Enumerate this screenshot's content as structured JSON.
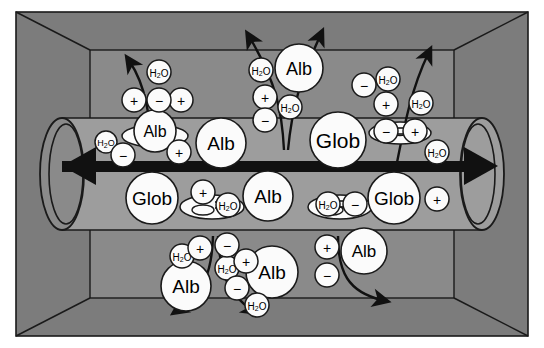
{
  "figure": {
    "colors": {
      "background": "#ffffff",
      "box_wall": "#7c7c7c",
      "box_interior": "#8a8a8a",
      "tube_fill": "#9d9d9d",
      "outline": "#1a1a1a",
      "particle_fill": "#fbfbfb",
      "flow_arrow": "#111111"
    }
  },
  "labels": {
    "albumin": "Alb",
    "globulin": "Glob",
    "water": "H",
    "water_sub": "2",
    "water_tail": "O",
    "cation": "+",
    "anion": "−"
  },
  "particles": {
    "albumin": [
      {
        "id": "alb-top-center",
        "cx": 299,
        "cy": 68,
        "r": 24
      },
      {
        "id": "alb-tube-left",
        "cx": 155,
        "cy": 131,
        "r": 21
      },
      {
        "id": "alb-tube-midleft",
        "cx": 221,
        "cy": 143,
        "r": 25
      },
      {
        "id": "alb-tube-midright",
        "cx": 268,
        "cy": 196,
        "r": 25
      },
      {
        "id": "alb-bottom-left",
        "cx": 186,
        "cy": 286,
        "r": 25
      },
      {
        "id": "alb-bottom-mid",
        "cx": 272,
        "cy": 272,
        "r": 26
      },
      {
        "id": "alb-bottom-right",
        "cx": 364,
        "cy": 251,
        "r": 23
      }
    ],
    "globulin": [
      {
        "id": "glob-tube-left",
        "cx": 152,
        "cy": 198,
        "r": 26
      },
      {
        "id": "glob-tube-center",
        "cx": 338,
        "cy": 140,
        "r": 28
      },
      {
        "id": "glob-tube-right",
        "cx": 394,
        "cy": 198,
        "r": 26
      }
    ],
    "water": [
      {
        "id": "h2o-top-left",
        "cx": 159,
        "cy": 72,
        "r": 12
      },
      {
        "id": "h2o-top-center",
        "cx": 261,
        "cy": 70,
        "r": 12
      },
      {
        "id": "h2o-top-center-low",
        "cx": 290,
        "cy": 107,
        "r": 12
      },
      {
        "id": "h2o-top-right-a",
        "cx": 388,
        "cy": 79,
        "r": 12
      },
      {
        "id": "h2o-top-right-b",
        "cx": 421,
        "cy": 103,
        "r": 12
      },
      {
        "id": "h2o-tube-left",
        "cx": 106,
        "cy": 142,
        "r": 11
      },
      {
        "id": "h2o-tube-right",
        "cx": 437,
        "cy": 152,
        "r": 12
      },
      {
        "id": "h2o-rbc-left",
        "cx": 228,
        "cy": 205,
        "r": 12
      },
      {
        "id": "h2o-rbc-right",
        "cx": 328,
        "cy": 204,
        "r": 12
      },
      {
        "id": "h2o-bottom-a",
        "cx": 182,
        "cy": 256,
        "r": 12
      },
      {
        "id": "h2o-bottom-b",
        "cx": 227,
        "cy": 268,
        "r": 12
      },
      {
        "id": "h2o-bottom-c",
        "cx": 257,
        "cy": 305,
        "r": 12
      }
    ],
    "cations": [
      {
        "id": "cat-top-left-a",
        "cx": 134,
        "cy": 100,
        "r": 12
      },
      {
        "id": "cat-top-left-b",
        "cx": 181,
        "cy": 100,
        "r": 12
      },
      {
        "id": "cat-top-center",
        "cx": 265,
        "cy": 97,
        "r": 12
      },
      {
        "id": "cat-top-right",
        "cx": 386,
        "cy": 104,
        "r": 12
      },
      {
        "id": "cat-tube-left",
        "cx": 179,
        "cy": 152,
        "r": 12
      },
      {
        "id": "cat-rbc-left",
        "cx": 203,
        "cy": 192,
        "r": 12
      },
      {
        "id": "cat-rbc-tright",
        "cx": 415,
        "cy": 131,
        "r": 12
      },
      {
        "id": "cat-tube-right",
        "cx": 437,
        "cy": 199,
        "r": 12
      },
      {
        "id": "cat-bottom-a",
        "cx": 200,
        "cy": 248,
        "r": 12
      },
      {
        "id": "cat-bottom-b",
        "cx": 246,
        "cy": 261,
        "r": 12
      },
      {
        "id": "cat-bottom-c",
        "cx": 327,
        "cy": 247,
        "r": 12
      }
    ],
    "anions": [
      {
        "id": "an-top-left",
        "cx": 159,
        "cy": 100,
        "r": 12
      },
      {
        "id": "an-top-center",
        "cx": 265,
        "cy": 120,
        "r": 12
      },
      {
        "id": "an-top-right",
        "cx": 364,
        "cy": 85,
        "r": 12
      },
      {
        "id": "an-tube-left",
        "cx": 123,
        "cy": 155,
        "r": 12
      },
      {
        "id": "an-rbc-tright",
        "cx": 386,
        "cy": 131,
        "r": 12
      },
      {
        "id": "an-rbc-right",
        "cx": 355,
        "cy": 204,
        "r": 12
      },
      {
        "id": "an-bottom-a",
        "cx": 227,
        "cy": 245,
        "r": 12
      },
      {
        "id": "an-bottom-b",
        "cx": 237,
        "cy": 288,
        "r": 12
      },
      {
        "id": "an-bottom-c",
        "cx": 327,
        "cy": 275,
        "r": 12
      }
    ],
    "red_cells": [
      {
        "id": "rbc-tube-upper-left",
        "cx": 155,
        "cy": 136,
        "rx": 33,
        "ry": 11
      },
      {
        "id": "rbc-tube-upper-right",
        "cx": 400,
        "cy": 133,
        "rx": 31,
        "ry": 11
      },
      {
        "id": "rbc-tube-lower-left",
        "cx": 212,
        "cy": 207,
        "rx": 32,
        "ry": 12
      },
      {
        "id": "rbc-tube-lower-right",
        "cx": 340,
        "cy": 207,
        "rx": 32,
        "ry": 12
      }
    ]
  },
  "flow_arrow": {
    "name": "bidirectional-blood-flow-arrow",
    "direction": "bidirectional",
    "y": 166
  },
  "exchange_arrows": [
    {
      "id": "arrow-top-left-out",
      "direction": "outward"
    },
    {
      "id": "arrow-top-center-left",
      "direction": "outward"
    },
    {
      "id": "arrow-top-center-right",
      "direction": "outward"
    },
    {
      "id": "arrow-top-right-out",
      "direction": "outward"
    },
    {
      "id": "arrow-bottom-left-out",
      "direction": "outward"
    },
    {
      "id": "arrow-bottom-center-out",
      "direction": "outward"
    },
    {
      "id": "arrow-bottom-right-out",
      "direction": "outward"
    }
  ]
}
